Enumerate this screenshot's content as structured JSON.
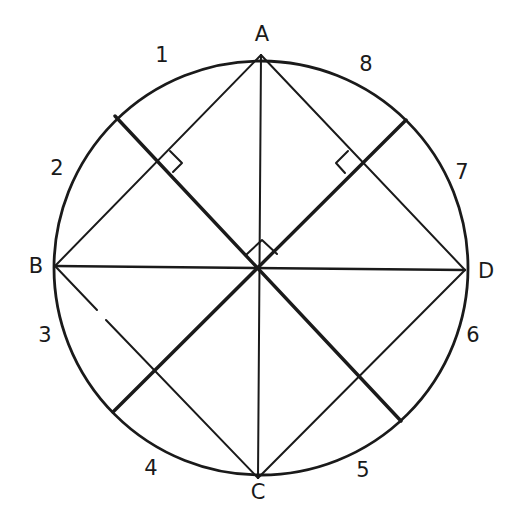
{
  "diagram": {
    "type": "geometry-figure",
    "circle": {
      "cx": 261,
      "cy": 268,
      "r": 207
    },
    "points": [
      {
        "id": "A",
        "label": "A",
        "x": 261,
        "y": 55,
        "label_x": 262,
        "label_y": 34
      },
      {
        "id": "B",
        "label": "B",
        "x": 55,
        "y": 266,
        "label_x": 36,
        "label_y": 266
      },
      {
        "id": "C",
        "label": "C",
        "x": 258,
        "y": 478,
        "label_x": 258,
        "label_y": 492
      },
      {
        "id": "D",
        "label": "D",
        "x": 465,
        "y": 270,
        "label_x": 486,
        "label_y": 271
      }
    ],
    "arc_labels": [
      {
        "id": "arc-1",
        "label": "1",
        "x": 162,
        "y": 55
      },
      {
        "id": "arc-2",
        "label": "2",
        "x": 57,
        "y": 168
      },
      {
        "id": "arc-3",
        "label": "3",
        "x": 45,
        "y": 335
      },
      {
        "id": "arc-4",
        "label": "4",
        "x": 151,
        "y": 468
      },
      {
        "id": "arc-5",
        "label": "5",
        "x": 363,
        "y": 470
      },
      {
        "id": "arc-6",
        "label": "6",
        "x": 473,
        "y": 335
      },
      {
        "id": "arc-7",
        "label": "7",
        "x": 462,
        "y": 172
      },
      {
        "id": "arc-8",
        "label": "8",
        "x": 366,
        "y": 64
      }
    ],
    "segments": [
      {
        "id": "AB",
        "from": "A",
        "to": "B",
        "weight": "thin"
      },
      {
        "id": "AD",
        "from": "A",
        "to": "D",
        "weight": "thin"
      },
      {
        "id": "BC",
        "from": "B",
        "to": "C",
        "weight": "thin",
        "note": "small gap near (100,320)"
      },
      {
        "id": "CD",
        "from": "C",
        "to": "D",
        "weight": "thin"
      },
      {
        "id": "AC",
        "from": "A",
        "to": "C",
        "weight": "thin"
      },
      {
        "id": "BD",
        "from": "B",
        "to": "D",
        "weight": "medium"
      },
      {
        "id": "diag-nw-se",
        "x1": 115,
        "y1": 116,
        "x2": 401,
        "y2": 421,
        "weight": "thick"
      },
      {
        "id": "diag-ne-sw",
        "x1": 406,
        "y1": 120,
        "x2": 113,
        "y2": 412,
        "weight": "thick"
      }
    ],
    "right_angle_markers": [
      {
        "id": "ra-ab",
        "at": [
          172,
          160
        ],
        "description": "at intersection of AB with NW diameter"
      },
      {
        "id": "ra-ad",
        "at": [
          343,
          162
        ],
        "description": "at intersection of AD with NE diameter"
      },
      {
        "id": "ra-center",
        "at": [
          261,
          245
        ],
        "description": "between AC and NE diameter near center"
      }
    ],
    "colors": {
      "ink": "#1a1a1a",
      "background": "#ffffff"
    }
  }
}
